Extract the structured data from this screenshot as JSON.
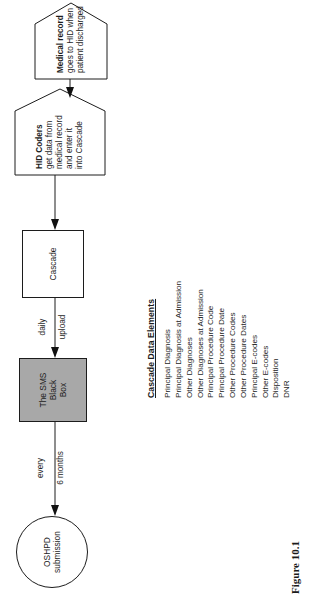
{
  "figure": {
    "caption": "Figure 10.1",
    "rotation_note": "page-rotated-90-ccw"
  },
  "nodes": {
    "oshpd": {
      "shape": "circle",
      "line1": "OSHPD",
      "line2": "submission"
    },
    "sms_black_box": {
      "shape": "rectangle-shaded",
      "fill": "#a8a8a8",
      "line1": "The SMS",
      "line2": "Black",
      "line3": "Box"
    },
    "cascade": {
      "shape": "rectangle",
      "label": "Cascade"
    },
    "hid_coders": {
      "shape": "pentagon",
      "title": "HID Coders",
      "line1": "get data from",
      "line2": "medical record",
      "line3": "and enter it",
      "line4": "into Cascade"
    },
    "medical_record": {
      "shape": "pentagon",
      "title": "Medical record",
      "line1": "goes to HID when",
      "line2": "patient discharged"
    }
  },
  "edges": {
    "sms_to_oshpd": {
      "line1": "every",
      "line2": "6 months"
    },
    "cascade_to_sms": {
      "line1": "daily",
      "line2": "upload"
    }
  },
  "data_elements": {
    "title": "Cascade Data Elements",
    "items": [
      "Principal Diagnosis",
      "Principal Diagnosis at Admission",
      "Other Diagnoses",
      "Other Diagnoses at Admission",
      "Principal Procedure Code",
      "Principal Procedure Date",
      "Other Procedure Codes",
      "Other Procedure Dates",
      "Principal E-codes",
      "Other E-codes",
      "Disposition",
      "DNR"
    ]
  },
  "colors": {
    "stroke": "#1c1c1c",
    "text": "#1d1d1d",
    "shaded_fill": "#a8a8a8",
    "background": "#ffffff"
  }
}
